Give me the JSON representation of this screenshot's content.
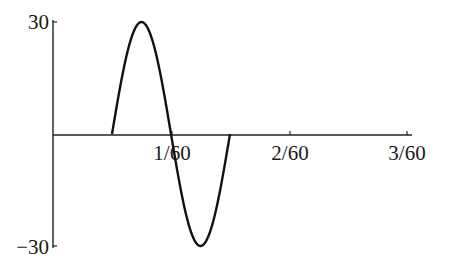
{
  "chart_data": {
    "type": "line",
    "title": "",
    "xlabel": "",
    "ylabel": "",
    "xlim": [
      0,
      0.0506
    ],
    "ylim": [
      -30,
      30
    ],
    "grid": false,
    "legend": null,
    "x_ticks": [
      {
        "value": 0.016667,
        "label": "1/60"
      },
      {
        "value": 0.033333,
        "label": "2/60"
      },
      {
        "value": 0.05,
        "label": "3/60"
      }
    ],
    "y_ticks": [
      {
        "value": 30,
        "label": "30"
      },
      {
        "value": -30,
        "label": "−30"
      }
    ],
    "series": [
      {
        "name": "signal",
        "description": "Single full sine period of amplitude 30 starting at t=1/120 and ending at t=3/120; zero elsewhere",
        "amplitude": 30,
        "period": 0.016667,
        "start": 0.008333,
        "end": 0.025,
        "x": [
          0,
          0.008333,
          0.0125,
          0.016667,
          0.020833,
          0.025,
          0.0333,
          0.05
        ],
        "y": [
          0,
          0,
          30,
          0,
          -30,
          0,
          0,
          0
        ]
      }
    ]
  }
}
